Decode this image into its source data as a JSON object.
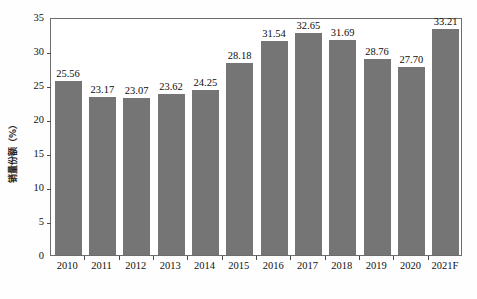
{
  "chart_data": {
    "type": "bar",
    "title": "",
    "xlabel": "",
    "ylabel": "销量份额（%）",
    "categories": [
      "2010",
      "2011",
      "2012",
      "2013",
      "2014",
      "2015",
      "2016",
      "2017",
      "2018",
      "2019",
      "2020",
      "2021F"
    ],
    "values": [
      25.56,
      23.17,
      23.07,
      23.62,
      24.25,
      28.18,
      31.54,
      32.65,
      31.69,
      28.76,
      27.7,
      33.21
    ],
    "value_labels": [
      "25.56",
      "23.17",
      "23.07",
      "23.62",
      "24.25",
      "28.18",
      "31.54",
      "32.65",
      "31.69",
      "28.76",
      "27.70",
      "33.21"
    ],
    "ylim": [
      0,
      35
    ],
    "yticks": [
      0,
      5,
      10,
      15,
      20,
      25,
      30,
      35
    ],
    "ytick_labels": [
      "0",
      "5",
      "10",
      "15",
      "20",
      "25",
      "30",
      "35"
    ],
    "grid": false,
    "legend": null,
    "legend_position": "none",
    "bar_color": "#757575",
    "axis_color": "#6d6d6d",
    "text_color": "#111111",
    "background_color": "#ffffff"
  }
}
